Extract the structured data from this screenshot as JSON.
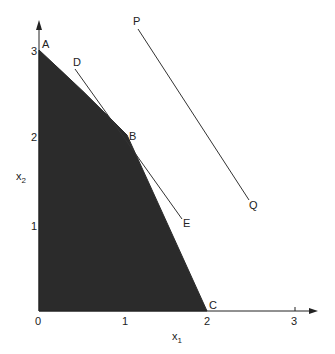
{
  "figure": {
    "type": "linear-programming feasible region",
    "axes": {
      "x_label": "x",
      "x_label_sub": "1",
      "y_label": "x",
      "y_label_sub": "2",
      "x_ticks": [
        "0",
        "1",
        "2",
        "3"
      ],
      "y_ticks": [
        "1",
        "2",
        "3"
      ]
    },
    "points": {
      "A": {
        "label": "A",
        "x": 0,
        "y": 3
      },
      "B": {
        "label": "B",
        "x": 1,
        "y": 2
      },
      "C": {
        "label": "C",
        "x": 2,
        "y": 0
      },
      "D": {
        "label": "D"
      },
      "E": {
        "label": "E"
      },
      "P": {
        "label": "P"
      },
      "Q": {
        "label": "Q"
      }
    },
    "lines": [
      {
        "name": "DE",
        "from": "D",
        "to": "E"
      },
      {
        "name": "PQ",
        "from": "P",
        "to": "Q"
      }
    ],
    "region": {
      "vertices": [
        "O",
        "A",
        "B",
        "C"
      ],
      "fill": "#2b2b2b"
    }
  }
}
